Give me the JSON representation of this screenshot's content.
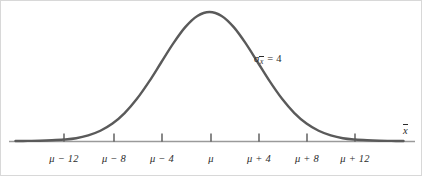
{
  "figure": {
    "title": "",
    "background_color": "#ffffff",
    "curve_color": "#5a5a5a",
    "axis_color": "#9a9a9a",
    "text_color": "#2b2b2b",
    "width": 422,
    "height": 176
  },
  "annotation": {
    "symbol": "σ",
    "subscript_base": "x",
    "subscript_overbar": true,
    "equals": "=",
    "value": "4",
    "full_text": "σx̄ = 4",
    "x": 253,
    "y": 52
  },
  "axis": {
    "name_base": "x",
    "name_overbar": true,
    "name_full": "x̄",
    "name_x": 404,
    "name_y": 124,
    "baseline_y": 140,
    "line_start_x": 8,
    "line_end_x": 414
  },
  "ticks": [
    {
      "label_mu": "μ",
      "label_op": "−",
      "label_num": "12",
      "label": "μ − 12",
      "x": 63,
      "value": -12
    },
    {
      "label_mu": "μ",
      "label_op": "−",
      "label_num": "8",
      "label": "μ − 8",
      "x": 113,
      "value": -8
    },
    {
      "label_mu": "μ",
      "label_op": "−",
      "label_num": "4",
      "label": "μ − 4",
      "x": 161,
      "value": -4
    },
    {
      "label_mu": "μ",
      "label_op": "",
      "label_num": "",
      "label": "μ",
      "x": 210,
      "value": 0
    },
    {
      "label_mu": "μ",
      "label_op": "+",
      "label_num": "4",
      "label": "μ + 4",
      "x": 258,
      "value": 4
    },
    {
      "label_mu": "μ",
      "label_op": "+",
      "label_num": "8",
      "label": "μ + 8",
      "x": 306,
      "value": 8
    },
    {
      "label_mu": "μ",
      "label_op": "+",
      "label_num": "12",
      "label": "μ + 12",
      "x": 354,
      "value": 12
    }
  ],
  "chart_data": {
    "type": "line",
    "title": "",
    "subtitle": "",
    "xlabel": "x̄",
    "ylabel": "",
    "grid": false,
    "legend": null,
    "distribution": "normal",
    "mean_label": "μ",
    "std_dev": 4,
    "std_dev_label": "σx̄ = 4",
    "xticklabels": [
      "μ − 12",
      "μ − 8",
      "μ − 4",
      "μ",
      "μ + 4",
      "μ + 8",
      "μ + 12"
    ],
    "xtickvalues": [
      -12,
      -8,
      -4,
      0,
      4,
      8,
      12
    ],
    "xlim": [
      -16.7,
      16.8
    ],
    "ylim": [
      0,
      1
    ],
    "annotations": [
      {
        "text": "σx̄ = 4",
        "x": 4.5,
        "y": 0.63
      }
    ],
    "x": [
      -16,
      -15,
      -14,
      -13,
      -12,
      -11,
      -10,
      -9,
      -8,
      -7,
      -6,
      -5,
      -4,
      -3,
      -2,
      -1,
      0,
      1,
      2,
      3,
      4,
      5,
      6,
      7,
      8,
      9,
      10,
      11,
      12,
      13,
      14,
      15,
      16
    ],
    "y": [
      0.0003,
      0.0008,
      0.0022,
      0.0054,
      0.0111,
      0.0216,
      0.0439,
      0.0796,
      0.1353,
      0.2163,
      0.3247,
      0.4578,
      0.6065,
      0.7548,
      0.8825,
      0.9692,
      1.0,
      0.9692,
      0.8825,
      0.7548,
      0.6065,
      0.4578,
      0.3247,
      0.2163,
      0.1353,
      0.0796,
      0.0439,
      0.0216,
      0.0111,
      0.0054,
      0.0022,
      0.0008,
      0.0003
    ]
  }
}
